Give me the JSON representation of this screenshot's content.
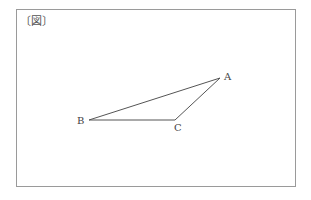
{
  "figure": {
    "label": "〔図〕",
    "shape": "triangle",
    "vertices": [
      {
        "name": "A",
        "x": 220,
        "y": 78
      },
      {
        "name": "B",
        "x": 89,
        "y": 120
      },
      {
        "name": "C",
        "x": 175,
        "y": 120
      }
    ],
    "line_color": "#555555"
  }
}
